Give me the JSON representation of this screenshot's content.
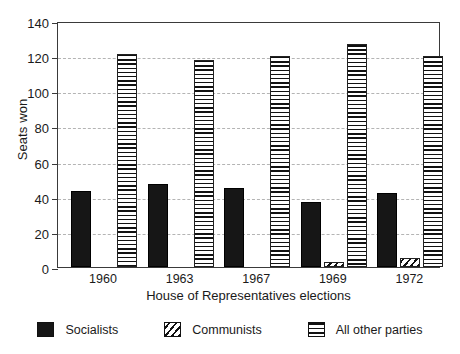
{
  "chart_data": {
    "type": "bar",
    "title": "",
    "xlabel": "House of Representatives elections",
    "ylabel": "Seats won",
    "categories": [
      "1960",
      "1963",
      "1967",
      "1969",
      "1972"
    ],
    "series": [
      {
        "name": "Socialists",
        "values": [
          43,
          47,
          45,
          37,
          42
        ]
      },
      {
        "name": "Communists",
        "values": [
          0,
          0,
          0,
          3,
          5
        ]
      },
      {
        "name": "All other parties",
        "values": [
          121,
          118,
          120,
          127,
          120
        ]
      }
    ],
    "ylim": [
      0,
      140
    ],
    "yticks": [
      0,
      20,
      40,
      60,
      80,
      100,
      120,
      140
    ],
    "ytick_labels": [
      "0",
      "20",
      "40",
      "60",
      "80",
      "100",
      "120",
      "140"
    ],
    "grid": true,
    "grid_axis": "y",
    "legend_position": "bottom",
    "legend_entries": [
      "Socialists",
      "Communists",
      "All other parties"
    ]
  },
  "colors": {
    "axis": "#3a3a3a",
    "grid": "#b4b4b4",
    "socialists": "#161616",
    "communists": "#111111",
    "other": "#111111",
    "background": "#ffffff"
  }
}
